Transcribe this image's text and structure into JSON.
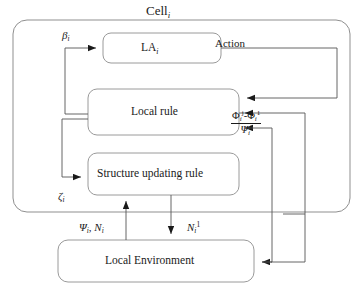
{
  "diagram": {
    "title": "Cell",
    "title_sub": "i",
    "colors": {
      "stroke": "#6e6e6e",
      "box_stroke": "#8a8a8a",
      "text": "#1a1a1a",
      "background": "#ffffff"
    },
    "boxes": [
      {
        "id": "la",
        "label": "LA",
        "sub": "i",
        "sup": ""
      },
      {
        "id": "local-rule",
        "label": "Local rule",
        "sub": "",
        "sup": ""
      },
      {
        "id": "structure-updating-rule",
        "label": "Structure updating rule",
        "sub": "",
        "sup": ""
      },
      {
        "id": "local-environment",
        "label": "Local Environment",
        "sub": "",
        "sup": ""
      }
    ],
    "signals": {
      "beta": {
        "base": "β",
        "sub": "i"
      },
      "zeta": {
        "base": "ζ",
        "sub": "i"
      },
      "action": "Action",
      "psi_n": {
        "psi": "Ψ",
        "psi_sub": "i",
        "sep": ", ",
        "n": "N",
        "n_sub": "i"
      },
      "n_sup1": {
        "base": "N",
        "sub": "i",
        "sup": "1"
      },
      "phi_diff": {
        "phi1": "Φ",
        "phi1_sub": "i",
        "phi1_sup": "j",
        "minus": "-",
        "phi2": "Φ",
        "phi2_sub": "i",
        "phi2_sup": "1"
      },
      "psi_sup": {
        "base": "Ψ",
        "sub": "i",
        "sup": "j"
      }
    }
  }
}
